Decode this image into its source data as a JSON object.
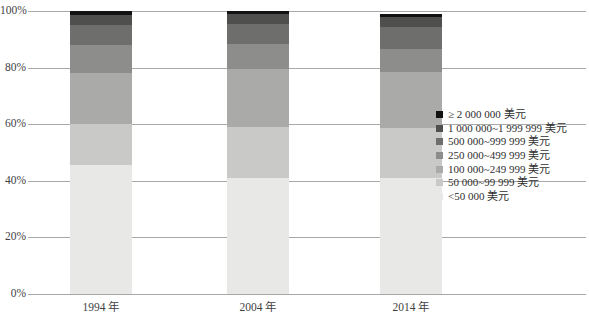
{
  "chart_data": {
    "type": "bar",
    "subtype": "stacked-100-percent",
    "title": "",
    "subtitle": "",
    "xlabel": "",
    "ylabel": "",
    "categories": [
      "1994 年",
      "2004 年",
      "2014 年"
    ],
    "ylim": [
      0,
      100
    ],
    "ytick_labels": [
      "0%",
      "20%",
      "40%",
      "60%",
      "80%",
      "100%"
    ],
    "ytick_values": [
      0,
      20,
      40,
      60,
      80,
      100
    ],
    "grid": true,
    "legend_position": "right",
    "unit": "percent",
    "series": [
      {
        "name": "<50 000 美元",
        "color": "#e8e8e6",
        "values": [
          45.5,
          41.0,
          41.0
        ]
      },
      {
        "name": "50 000~99 999 美元",
        "color": "#c9c9c7",
        "values": [
          14.5,
          18.0,
          17.5
        ]
      },
      {
        "name": "100 000~249 999 美元",
        "color": "#aaaaa8",
        "values": [
          18.0,
          20.5,
          20.0
        ]
      },
      {
        "name": "250 000~499 999 美元",
        "color": "#8d8d8b",
        "values": [
          10.0,
          9.0,
          8.0
        ]
      },
      {
        "name": "500 000~999 999 美元",
        "color": "#6e6e6c",
        "values": [
          7.0,
          7.0,
          8.0
        ]
      },
      {
        "name": "1 000 000~1 999 999 美元",
        "color": "#4f4f4d",
        "values": [
          3.5,
          3.5,
          3.5
        ]
      },
      {
        "name": "≥ 2 000 000 美元",
        "color": "#121212",
        "values": [
          1.5,
          1.0,
          1.0
        ]
      }
    ],
    "legend_entries": [
      {
        "label": "≥ 2 000 000 美元",
        "color": "#121212"
      },
      {
        "label": "1 000 000~1 999 999 美元",
        "color": "#4f4f4d"
      },
      {
        "label": "500 000~999 999 美元",
        "color": "#6e6e6c"
      },
      {
        "label": "250 000~499 999 美元",
        "color": "#8d8d8b"
      },
      {
        "label": "100 000~249 999 美元",
        "color": "#aaaaa8"
      },
      {
        "label": "50 000~99 999 美元",
        "color": "#c9c9c7"
      },
      {
        "label": "<50 000 美元",
        "color": "#e8e8e6"
      }
    ]
  },
  "axis": {
    "ticks": [
      {
        "label": "100%",
        "value": 100
      },
      {
        "label": "80%",
        "value": 80
      },
      {
        "label": "60%",
        "value": 60
      },
      {
        "label": "40%",
        "value": 40
      },
      {
        "label": "20%",
        "value": 20
      },
      {
        "label": "0%",
        "value": 0
      }
    ]
  },
  "colors": {
    "gridline": "#a8a8a8",
    "text": "#3f3f3f",
    "background": "#ffffff"
  }
}
